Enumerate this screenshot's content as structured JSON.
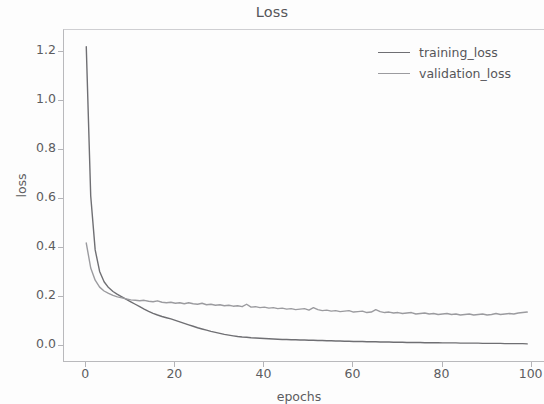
{
  "chart_data": {
    "type": "line",
    "title": "Loss",
    "xlabel": "epochs",
    "ylabel": "loss",
    "xlim": [
      -5,
      103
    ],
    "ylim": [
      -0.07,
      1.29
    ],
    "grid": false,
    "legend_position": "upper right",
    "xticks": [
      0,
      20,
      40,
      60,
      80,
      100
    ],
    "xtick_labels": [
      "0",
      "20",
      "40",
      "60",
      "80",
      "100"
    ],
    "yticks": [
      0.0,
      0.2,
      0.4,
      0.6,
      0.8,
      1.0,
      1.2
    ],
    "ytick_labels": [
      "0.0",
      "0.2",
      "0.4",
      "0.6",
      "0.8",
      "1.0",
      "1.2"
    ],
    "x": [
      0,
      1,
      2,
      3,
      4,
      5,
      6,
      7,
      8,
      9,
      10,
      11,
      12,
      13,
      14,
      15,
      16,
      17,
      18,
      19,
      20,
      21,
      22,
      23,
      24,
      25,
      26,
      27,
      28,
      29,
      30,
      31,
      32,
      33,
      34,
      35,
      36,
      37,
      38,
      39,
      40,
      41,
      42,
      43,
      44,
      45,
      46,
      47,
      48,
      49,
      50,
      51,
      52,
      53,
      54,
      55,
      56,
      57,
      58,
      59,
      60,
      61,
      62,
      63,
      64,
      65,
      66,
      67,
      68,
      69,
      70,
      71,
      72,
      73,
      74,
      75,
      76,
      77,
      78,
      79,
      80,
      81,
      82,
      83,
      84,
      85,
      86,
      87,
      88,
      89,
      90,
      91,
      92,
      93,
      94,
      95,
      96,
      97,
      98,
      99
    ],
    "series": [
      {
        "name": "training_loss",
        "color": "#6f6f73",
        "values": [
          1.222,
          0.612,
          0.392,
          0.304,
          0.262,
          0.238,
          0.222,
          0.21,
          0.2,
          0.19,
          0.18,
          0.17,
          0.16,
          0.15,
          0.141,
          0.133,
          0.126,
          0.12,
          0.115,
          0.11,
          0.104,
          0.098,
          0.092,
          0.086,
          0.08,
          0.074,
          0.069,
          0.064,
          0.059,
          0.055,
          0.051,
          0.047,
          0.044,
          0.041,
          0.038,
          0.036,
          0.035,
          0.033,
          0.032,
          0.031,
          0.03,
          0.029,
          0.028,
          0.027,
          0.026,
          0.026,
          0.025,
          0.025,
          0.024,
          0.024,
          0.023,
          0.023,
          0.022,
          0.022,
          0.021,
          0.021,
          0.02,
          0.02,
          0.019,
          0.019,
          0.018,
          0.018,
          0.018,
          0.017,
          0.017,
          0.017,
          0.016,
          0.016,
          0.016,
          0.015,
          0.015,
          0.015,
          0.014,
          0.014,
          0.014,
          0.014,
          0.013,
          0.013,
          0.013,
          0.013,
          0.012,
          0.012,
          0.012,
          0.012,
          0.011,
          0.011,
          0.011,
          0.011,
          0.011,
          0.01,
          0.01,
          0.01,
          0.01,
          0.01,
          0.009,
          0.009,
          0.009,
          0.009,
          0.009,
          0.008
        ]
      },
      {
        "name": "validation_loss",
        "color": "#9b9b9f",
        "values": [
          0.42,
          0.318,
          0.268,
          0.24,
          0.224,
          0.214,
          0.206,
          0.2,
          0.196,
          0.192,
          0.188,
          0.186,
          0.184,
          0.186,
          0.182,
          0.18,
          0.184,
          0.178,
          0.176,
          0.178,
          0.174,
          0.176,
          0.172,
          0.176,
          0.172,
          0.17,
          0.174,
          0.168,
          0.17,
          0.166,
          0.168,
          0.164,
          0.166,
          0.162,
          0.164,
          0.16,
          0.17,
          0.158,
          0.16,
          0.156,
          0.158,
          0.154,
          0.156,
          0.152,
          0.154,
          0.15,
          0.152,
          0.148,
          0.15,
          0.152,
          0.146,
          0.156,
          0.148,
          0.144,
          0.146,
          0.142,
          0.144,
          0.14,
          0.142,
          0.144,
          0.138,
          0.14,
          0.142,
          0.136,
          0.138,
          0.148,
          0.14,
          0.136,
          0.138,
          0.134,
          0.136,
          0.132,
          0.134,
          0.136,
          0.13,
          0.132,
          0.134,
          0.13,
          0.132,
          0.128,
          0.13,
          0.132,
          0.128,
          0.13,
          0.126,
          0.128,
          0.13,
          0.126,
          0.128,
          0.13,
          0.126,
          0.128,
          0.132,
          0.128,
          0.13,
          0.132,
          0.13,
          0.134,
          0.136,
          0.138
        ]
      }
    ]
  },
  "legend": {
    "items": [
      {
        "label": "training_loss"
      },
      {
        "label": "validation_loss"
      }
    ]
  }
}
